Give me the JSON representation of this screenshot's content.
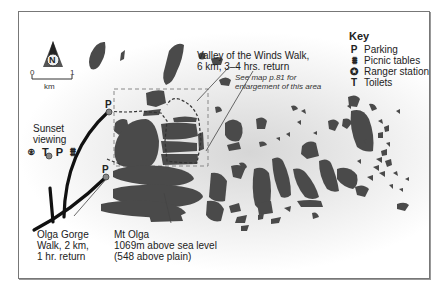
{
  "map": {
    "labels": {
      "valley_walk_line1": "Valley of the Winds Walk,",
      "valley_walk_line2": "6 km, 3–4 hrs. return",
      "see_map_line1": "See map p.81 for",
      "see_map_line2": "enlargement of this area",
      "sunset_line1": "Sunset",
      "sunset_line2": "viewing",
      "sunset_symbols": "⍟ T P ⩩",
      "olga_gorge_line1": "Olga Gorge",
      "olga_gorge_line2": "Walk, 2 km,",
      "olga_gorge_line3": "1 hr. return",
      "mt_olga_line1": "Mt Olga",
      "mt_olga_line2": "1069m above sea level",
      "mt_olga_line3": "(548 above plain)",
      "parking_marker_1": "P",
      "parking_marker_2": "P"
    },
    "compass": {
      "letter": "N",
      "icon": "north-arrow-icon"
    },
    "scale": {
      "start": "0",
      "end": "1",
      "unit": "km"
    },
    "key": {
      "title": "Key",
      "items": [
        {
          "symbol": "P",
          "icon": "parking-icon",
          "label": "Parking"
        },
        {
          "symbol": "⩩",
          "icon": "picnic-table-icon",
          "label": "Picnic tables"
        },
        {
          "symbol": "✪",
          "icon": "ranger-station-icon",
          "label": "Ranger station"
        },
        {
          "symbol": "T",
          "icon": "toilets-icon",
          "label": "Toilets"
        }
      ]
    },
    "colors": {
      "rock": "#4a4a4a",
      "road": "#111111",
      "frame": "#777777",
      "dashed": "#888888"
    }
  }
}
